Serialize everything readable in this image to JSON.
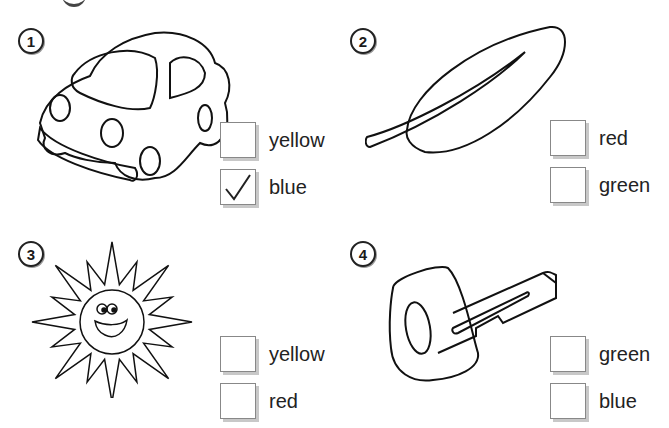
{
  "exercises": [
    {
      "number": "1",
      "picture": "car",
      "options": [
        {
          "label": "yellow",
          "checked": false
        },
        {
          "label": "blue",
          "checked": true
        }
      ]
    },
    {
      "number": "2",
      "picture": "leaf",
      "options": [
        {
          "label": "red",
          "checked": false
        },
        {
          "label": "green",
          "checked": false
        }
      ]
    },
    {
      "number": "3",
      "picture": "sun",
      "options": [
        {
          "label": "yellow",
          "checked": false
        },
        {
          "label": "red",
          "checked": false
        }
      ]
    },
    {
      "number": "4",
      "picture": "key",
      "options": [
        {
          "label": "green",
          "checked": false
        },
        {
          "label": "blue",
          "checked": false
        }
      ]
    }
  ],
  "icons": {
    "check": "checkmark-icon"
  }
}
